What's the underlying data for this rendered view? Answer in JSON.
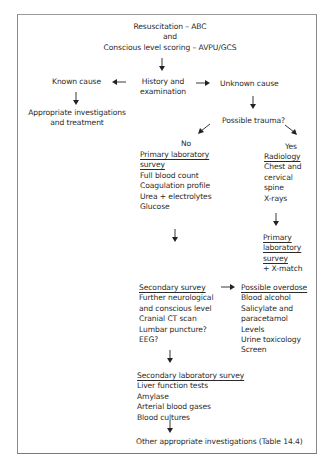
{
  "diagram": {
    "top": {
      "line1": "Resuscitation – ABC",
      "line2": "and",
      "line3": "Conscious level scoring – AVPU/GCS"
    },
    "history": {
      "line1": "History and",
      "line2": "examination"
    },
    "known_cause": {
      "label": "Known cause",
      "result_line1": "Appropriate investigations",
      "result_line2": "and treatment"
    },
    "unknown_cause": {
      "label": "Unknown cause"
    },
    "possible_trauma": {
      "label": "Possible trauma?"
    },
    "no_branch": {
      "label": "No",
      "heading_line1": "Primary laboratory",
      "heading_line2": "survey",
      "items": [
        "Full blood count",
        "Coagulation profile",
        "Urea + electrolytes",
        "Glucose"
      ]
    },
    "yes_branch": {
      "label": "Yes",
      "heading": "Radiology",
      "items": [
        "Chest and",
        "cervical",
        "spine",
        "X-rays"
      ],
      "primary_lab": {
        "heading_lines": [
          "Primary",
          "laboratory",
          "survey"
        ],
        "extra": "+ X-match"
      }
    },
    "secondary_survey": {
      "heading": "Secondary survey",
      "items": [
        "Further neurological",
        "and conscious level",
        "Cranial CT scan",
        "Lumbar puncture?",
        "EEG?"
      ]
    },
    "possible_overdose": {
      "heading": "Possible overdose",
      "items": [
        "Blood alcohol",
        "Salicylate and",
        "paracetamol",
        "Levels",
        "Urine toxicology",
        "Screen"
      ]
    },
    "secondary_lab_survey": {
      "heading": "Secondary laboratory survey",
      "items": [
        "Liver function tests",
        "Amylase",
        "Arterial blood gases",
        "Blood cultures"
      ]
    },
    "final": {
      "label": "Other appropriate investigations (Table 14.4)"
    }
  }
}
